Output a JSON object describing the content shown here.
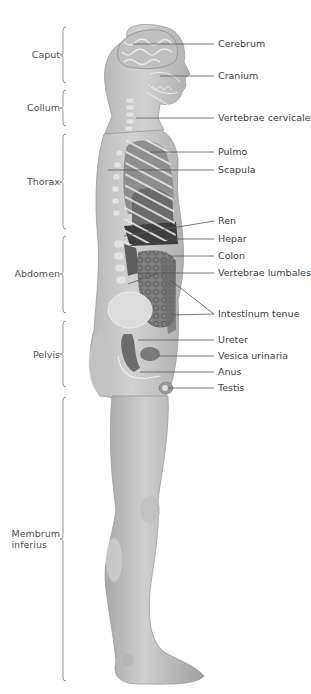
{
  "diagram": {
    "type": "anatomical-illustration",
    "view": "lateral (right side) view of male human body, internal organs exposed",
    "regions": [
      {
        "label": "Caput",
        "top": 27,
        "bottom": 83
      },
      {
        "label": "Collum",
        "top": 90,
        "bottom": 126
      },
      {
        "label": "Thorax",
        "top": 134,
        "bottom": 229
      },
      {
        "label": "Abdomen",
        "top": 236,
        "bottom": 313
      },
      {
        "label": "Pelvis",
        "top": 321,
        "bottom": 390
      },
      {
        "label": "Membrum\ninferius",
        "top": 397,
        "bottom": 683
      }
    ],
    "structures": [
      {
        "label": "Cerebrum",
        "y": 44
      },
      {
        "label": "Cranium",
        "y": 76
      },
      {
        "label": "Vertebrae cervicales",
        "y": 118
      },
      {
        "label": "Pulmo",
        "y": 152
      },
      {
        "label": "Scapula",
        "y": 170
      },
      {
        "label": "Ren",
        "y": 221
      },
      {
        "label": "Hepar",
        "y": 239
      },
      {
        "label": "Colon",
        "y": 256
      },
      {
        "label": "Vertebrae lumbales",
        "y": 273
      },
      {
        "label": "Intestinum tenue",
        "y": 314
      },
      {
        "label": "Ureter",
        "y": 340
      },
      {
        "label": "Vesica urinaria",
        "y": 356
      },
      {
        "label": "Anus",
        "y": 372
      },
      {
        "label": "Testis",
        "y": 388
      }
    ],
    "colors": {
      "skin": "#c9c9c9",
      "skin_shadow": "#a9a9a9",
      "organ_dark": "#5a5a5a",
      "organ_mid": "#8a8a8a",
      "bone": "#e6e6e6",
      "leader_line": "#555555",
      "brace": "#777777"
    }
  }
}
